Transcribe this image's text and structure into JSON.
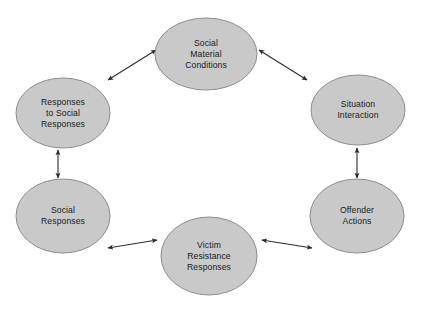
{
  "diagram": {
    "background_color": "#ffffff",
    "node_fill_color": "#c9c9c9",
    "node_stroke_color": "#8e8e8e",
    "edge_color": "#2b2b2b",
    "text_color": "#1a1a1a",
    "nodes": [
      {
        "id": "social-material-conditions",
        "label": "Social\nMaterial\nConditions",
        "cx": 206,
        "cy": 54,
        "rx": 51,
        "ry": 36
      },
      {
        "id": "situation-interaction",
        "label": "Situation\nInteraction",
        "cx": 358,
        "cy": 110,
        "rx": 47,
        "ry": 35
      },
      {
        "id": "offender-actions",
        "label": "Offender\nActions",
        "cx": 357,
        "cy": 216,
        "rx": 47,
        "ry": 37
      },
      {
        "id": "victim-resistance-responses",
        "label": "Victim\nResistance\nResponses",
        "cx": 209,
        "cy": 256,
        "rx": 48,
        "ry": 39
      },
      {
        "id": "social-responses",
        "label": "Social\nResponses",
        "cx": 63,
        "cy": 216,
        "rx": 47,
        "ry": 37
      },
      {
        "id": "responses-to-social-responses",
        "label": "Responses\nto Social\nResponses",
        "cx": 63,
        "cy": 113,
        "rx": 47,
        "ry": 35
      }
    ],
    "edges": [
      {
        "id": "edge-responses-to-social-responses--social-material-conditions",
        "from": "responses-to-social-responses",
        "to": "social-material-conditions",
        "direction": "bidirectional",
        "x1": 108,
        "y1": 80,
        "x2": 156,
        "y2": 50
      },
      {
        "id": "edge-social-material-conditions--situation-interaction",
        "from": "social-material-conditions",
        "to": "situation-interaction",
        "direction": "bidirectional",
        "x1": 259,
        "y1": 50,
        "x2": 307,
        "y2": 80
      },
      {
        "id": "edge-situation-interaction--offender-actions",
        "from": "situation-interaction",
        "to": "offender-actions",
        "direction": "bidirectional",
        "x1": 357,
        "y1": 148,
        "x2": 357,
        "y2": 178
      },
      {
        "id": "edge-offender-actions--victim-resistance-responses",
        "from": "offender-actions",
        "to": "victim-resistance-responses",
        "direction": "bidirectional",
        "x1": 312,
        "y1": 248,
        "x2": 262,
        "y2": 240
      },
      {
        "id": "edge-victim-resistance-responses--social-responses",
        "from": "victim-resistance-responses",
        "to": "social-responses",
        "direction": "bidirectional",
        "x1": 157,
        "y1": 240,
        "x2": 108,
        "y2": 248
      },
      {
        "id": "edge-social-responses--responses-to-social-responses",
        "from": "social-responses",
        "to": "responses-to-social-responses",
        "direction": "bidirectional",
        "x1": 58,
        "y1": 178,
        "x2": 58,
        "y2": 150
      }
    ]
  }
}
